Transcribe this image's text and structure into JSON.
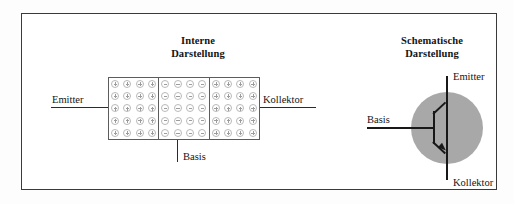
{
  "figure": {
    "kind": "transistor-diagram",
    "background_color": "#ffffff",
    "border_color": "#3a3a3a"
  },
  "panels": {
    "internal": {
      "title": "Interne\nDarstellung",
      "box": {
        "regions": [
          {
            "doping": "p",
            "symbol": "plus",
            "columns": 4,
            "rows": 5
          },
          {
            "doping": "n",
            "symbol": "minus",
            "columns": 4,
            "rows": 5
          },
          {
            "doping": "p",
            "symbol": "plus",
            "columns": 4,
            "rows": 5
          }
        ],
        "carrier_outline_color": "#b9b9b9",
        "carrier_mark_color": "#9c9c9c",
        "box_border_color": "#5c5c5c"
      },
      "terminals": {
        "emitter": "Emitter",
        "kollektor": "Kollektor",
        "basis": "Basis"
      }
    },
    "schematic": {
      "title": "Schematische\nDarstellung",
      "symbol": {
        "type": "bipolar-transistor",
        "polarity": "pnp",
        "circle_fill": "#a8a8a8",
        "line_color": "#181818",
        "arrow_on": "collector"
      },
      "terminals": {
        "emitter": "Emitter",
        "basis": "Basis",
        "kollektor": "Kollektor"
      }
    }
  }
}
